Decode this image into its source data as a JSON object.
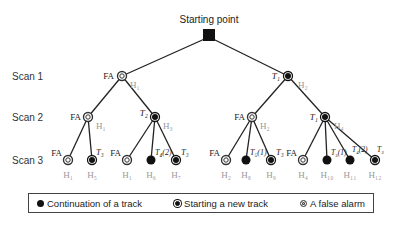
{
  "title": "Starting point",
  "scan_labels": [
    "Scan 1",
    "Scan 2",
    "Scan 3"
  ],
  "colors": {
    "line": "#222222",
    "hyp_label": "#999999",
    "node": "#111111"
  },
  "nodes": {
    "s1_fa": {
      "label": "FA",
      "hyp": "H₁",
      "type": "false-alarm"
    },
    "s1_t": {
      "label": "T₁",
      "hyp": "H₂",
      "type": "new-track"
    },
    "s2_fa_a": {
      "label": "FA",
      "hyp": "H₁",
      "type": "false-alarm"
    },
    "s2_t2": {
      "label": "T₂",
      "hyp": "H₃",
      "type": "new-track"
    },
    "s2_fa_b": {
      "label": "FA",
      "hyp": "H₂",
      "type": "false-alarm"
    },
    "s2_t1": {
      "label": "T₁",
      "hyp": "H₄",
      "type": "new-track"
    }
  },
  "leaves": [
    {
      "label": "FA",
      "hyp": "H₁",
      "type": "false-alarm"
    },
    {
      "label": "T₃",
      "hyp": "H₅",
      "type": "new-track"
    },
    {
      "label": "FA",
      "hyp": "H₁",
      "type": "false-alarm"
    },
    {
      "label": "T₄(2)",
      "hyp": "H₆",
      "type": "continuation"
    },
    {
      "label": "T₃",
      "hyp": "H₇",
      "type": "new-track"
    },
    {
      "label": "FA",
      "hyp": "H₂",
      "type": "false-alarm"
    },
    {
      "label": "T₅(1)",
      "hyp": "H₈",
      "type": "continuation"
    },
    {
      "label": "T₃",
      "hyp": "H₉",
      "type": "new-track"
    },
    {
      "label": "FA",
      "hyp": "H₄",
      "type": "false-alarm"
    },
    {
      "label": "T₅(1)",
      "hyp": "H₁₀",
      "type": "continuation"
    },
    {
      "label": "T₄(2)",
      "hyp": "H₁₁",
      "type": "continuation"
    },
    {
      "label": "T₃",
      "hyp": "H₁₂",
      "type": "new-track"
    }
  ],
  "legend": {
    "continuation": "Continuation of a track",
    "new_track": "Starting a new track",
    "false_alarm": "A false alarm"
  }
}
